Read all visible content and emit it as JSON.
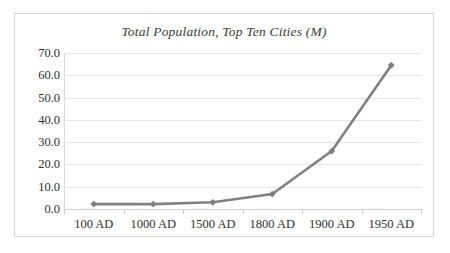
{
  "chart_data": {
    "type": "line",
    "title": "Total Population, Top Ten Cities (M)",
    "xlabel": "",
    "ylabel": "",
    "categories": [
      "100 AD",
      "1000 AD",
      "1500 AD",
      "1800 AD",
      "1900 AD",
      "1950 AD"
    ],
    "values": [
      2.2,
      2.2,
      3.0,
      6.7,
      26.0,
      64.5
    ],
    "series": [
      {
        "name": "Total Population, Top Ten Cities (M)",
        "values": [
          2.2,
          2.2,
          3.0,
          6.7,
          26.0,
          64.5
        ]
      }
    ],
    "ylim": [
      0.0,
      70.0
    ],
    "y_tick_step": 10.0,
    "y_ticks": [
      "70.0",
      "60.0",
      "50.0",
      "40.0",
      "30.0",
      "20.0",
      "10.0",
      "0.0"
    ],
    "y_tick_values": [
      70.0,
      60.0,
      50.0,
      40.0,
      30.0,
      20.0,
      10.0,
      0.0
    ],
    "grid": true,
    "legend": false,
    "legend_position": "none",
    "marker": "diamond",
    "colors": {
      "line": "#808080",
      "marker": "#7f7f7f",
      "gridline": "#e4e4e4",
      "axis": "#d0d0d0",
      "border": "#d4d4d4",
      "background": "#ffffff",
      "text": "#2f2f2f",
      "title_text": "#3a3a3a"
    }
  }
}
